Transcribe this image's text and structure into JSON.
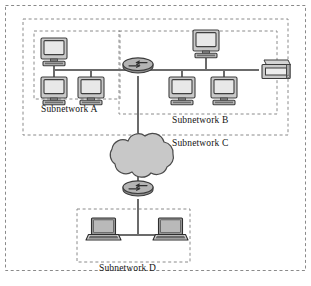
{
  "figure": {
    "kind": "network-topology-diagram",
    "background": "#ffffff",
    "stroke_color": "#555555",
    "dash_color": "#8a8a8a",
    "device_fill": "#c9c9c9",
    "device_dark": "#4a4a4a",
    "cloud_fill": "#c8c8c8"
  },
  "labels": {
    "subnet_a": "Subnetwork A",
    "subnet_b": "Subnetwork B",
    "subnet_c": "Subnetwork C",
    "subnet_d": "Subnetwork D"
  },
  "boundaries": [
    {
      "id": "outer-frame",
      "name": "outer-dashed-frame"
    },
    {
      "id": "subnet-c-box",
      "name": "subnetwork-c-boundary"
    },
    {
      "id": "subnet-a-box",
      "name": "subnetwork-a-boundary"
    },
    {
      "id": "subnet-b-box",
      "name": "subnetwork-b-boundary"
    },
    {
      "id": "subnet-d-box",
      "name": "subnetwork-d-boundary"
    }
  ],
  "nodes": {
    "subnet_a_computers": 3,
    "subnet_b_computers": 3,
    "subnet_b_printers": 1,
    "subnet_d_laptops": 2,
    "routers": 2,
    "clouds": 1
  },
  "topology": {
    "description": "Subnetwork A and Subnetwork B are joined by a central router; together they form Subnetwork C, which connects through a cloud and a second router down to Subnetwork D."
  }
}
